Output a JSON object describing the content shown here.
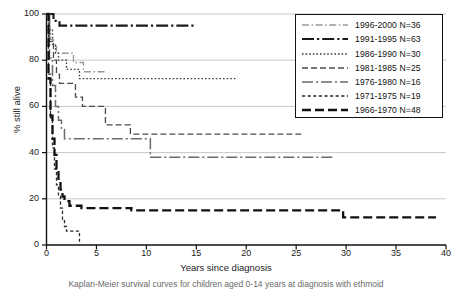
{
  "chart_data": {
    "type": "line",
    "title": "",
    "subtitle": "",
    "xlabel": "Years since diagnosis",
    "ylabel": "% still alive",
    "xlim": [
      0,
      40
    ],
    "ylim": [
      0,
      100
    ],
    "xticks": [
      0,
      5,
      10,
      15,
      20,
      25,
      30,
      35,
      40
    ],
    "yticks": [
      0,
      20,
      40,
      60,
      80,
      100
    ],
    "grid": "horizontal",
    "legend_position": "top-right",
    "series": [
      {
        "name": "1996-2000 N=36",
        "label": "1996-2000",
        "n": 36,
        "dash": "light-dashdot",
        "color": "#999999",
        "width": 1.3,
        "points": [
          [
            0,
            100
          ],
          [
            0.2,
            94
          ],
          [
            0.4,
            89
          ],
          [
            0.7,
            86
          ],
          [
            1.0,
            83
          ],
          [
            2.6,
            83
          ],
          [
            2.7,
            79
          ],
          [
            3.6,
            79
          ],
          [
            3.7,
            75
          ],
          [
            6.0,
            75
          ]
        ]
      },
      {
        "name": "1991-1995 N=63",
        "label": "1991-1995",
        "n": 63,
        "dash": "heavy-dashdot",
        "color": "#1a1a1a",
        "width": 2.2,
        "points": [
          [
            0,
            100
          ],
          [
            0.6,
            100
          ],
          [
            0.7,
            97
          ],
          [
            1.2,
            97
          ],
          [
            1.3,
            95
          ],
          [
            14.8,
            95
          ]
        ]
      },
      {
        "name": "1986-1990 N=30",
        "label": "1986-1990",
        "n": 30,
        "dash": "dotted",
        "color": "#3a3a3a",
        "width": 1.3,
        "points": [
          [
            0,
            100
          ],
          [
            0.3,
            93
          ],
          [
            0.6,
            87
          ],
          [
            0.9,
            83
          ],
          [
            1.2,
            80
          ],
          [
            1.9,
            80
          ],
          [
            2.0,
            76
          ],
          [
            3.2,
            76
          ],
          [
            3.3,
            72
          ],
          [
            19.0,
            72
          ]
        ]
      },
      {
        "name": "1981-1985 N=25",
        "label": "1981-1985",
        "n": 25,
        "dash": "dashed",
        "color": "#4a4a4a",
        "width": 1.3,
        "points": [
          [
            0,
            100
          ],
          [
            0.3,
            88
          ],
          [
            0.7,
            80
          ],
          [
            1.0,
            74
          ],
          [
            1.3,
            70
          ],
          [
            2.8,
            70
          ],
          [
            2.9,
            64
          ],
          [
            3.5,
            64
          ],
          [
            3.6,
            60
          ],
          [
            5.8,
            60
          ],
          [
            5.9,
            52
          ],
          [
            8.3,
            52
          ],
          [
            8.4,
            48
          ],
          [
            25.5,
            48
          ]
        ]
      },
      {
        "name": "1976-1980 N=16",
        "label": "1976-1980",
        "n": 16,
        "dash": "long-dashdot",
        "color": "#6a6a6a",
        "width": 1.5,
        "points": [
          [
            0,
            100
          ],
          [
            0.3,
            81
          ],
          [
            0.6,
            69
          ],
          [
            0.9,
            60
          ],
          [
            1.2,
            54
          ],
          [
            1.5,
            50
          ],
          [
            1.8,
            46
          ],
          [
            10.3,
            46
          ],
          [
            10.4,
            38
          ],
          [
            28.8,
            38
          ]
        ]
      },
      {
        "name": "1971-1975 N=19",
        "label": "1971-1975",
        "n": 19,
        "dash": "short-dashed",
        "color": "#2a2a2a",
        "width": 1.3,
        "points": [
          [
            0,
            100
          ],
          [
            0.2,
            74
          ],
          [
            0.4,
            55
          ],
          [
            0.6,
            42
          ],
          [
            0.8,
            33
          ],
          [
            1.0,
            26
          ],
          [
            1.2,
            21
          ],
          [
            1.4,
            16
          ],
          [
            1.6,
            11
          ],
          [
            1.8,
            8
          ],
          [
            2.0,
            6
          ],
          [
            3.2,
            6
          ],
          [
            3.3,
            0
          ]
        ]
      },
      {
        "name": "1966-1970 N=48",
        "label": "1966-1970",
        "n": 48,
        "dash": "long-dash",
        "color": "#111111",
        "width": 2.3,
        "points": [
          [
            0,
            100
          ],
          [
            0.2,
            72
          ],
          [
            0.4,
            56
          ],
          [
            0.6,
            46
          ],
          [
            0.8,
            39
          ],
          [
            1.0,
            33
          ],
          [
            1.2,
            28
          ],
          [
            1.4,
            24
          ],
          [
            1.6,
            21
          ],
          [
            1.8,
            19
          ],
          [
            2.2,
            19
          ],
          [
            2.3,
            17
          ],
          [
            3.4,
            17
          ],
          [
            3.5,
            16
          ],
          [
            8.4,
            16
          ],
          [
            8.5,
            15
          ],
          [
            29.6,
            15
          ],
          [
            29.7,
            12
          ],
          [
            39.0,
            12
          ]
        ]
      }
    ]
  },
  "axis": {
    "ylabel": "% still alive",
    "xlabel": "Years since diagnosis"
  },
  "legend": {
    "entries": [
      {
        "text": "1996-2000 N=36"
      },
      {
        "text": "1991-1995 N=63"
      },
      {
        "text": "1986-1990 N=30"
      },
      {
        "text": "1981-1985 N=25"
      },
      {
        "text": "1976-1980 N=16"
      },
      {
        "text": "1971-1975 N=19"
      },
      {
        "text": "1966-1970 N=48"
      }
    ]
  },
  "caption": {
    "text": "Kaplan-Meier survival curves for children aged 0-14 years at diagnosis with ethmoid"
  }
}
